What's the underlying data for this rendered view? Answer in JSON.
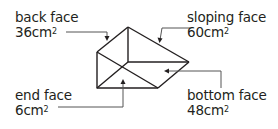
{
  "labels": {
    "back": {
      "name": "back face",
      "area": "36",
      "unit": "cm",
      "exp": "2"
    },
    "sloping": {
      "name": "sloping face",
      "area": "60",
      "unit": "cm",
      "exp": "2"
    },
    "end": {
      "name": "end face",
      "area": "6",
      "unit": "cm",
      "exp": "2"
    },
    "bottom": {
      "name": "bottom face",
      "area": "48",
      "unit": "cm",
      "exp": "2"
    }
  },
  "colors": {
    "line": "#231f20",
    "leader": "#555555"
  }
}
